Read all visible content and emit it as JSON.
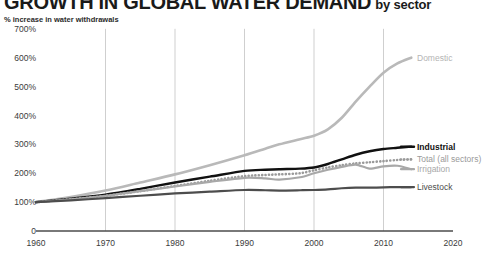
{
  "header": {
    "title": "GROWTH IN GLOBAL WATER DEMAND",
    "title_suffix": "by sector",
    "subtitle": "% increase in water withdrawals"
  },
  "chart_data": {
    "type": "line",
    "subtitle": "% increase in water withdrawals",
    "xlabel": "",
    "ylabel": "% increase in water withdrawals",
    "xlim": [
      1960,
      2020
    ],
    "ylim": [
      0,
      700
    ],
    "grid": "vertical",
    "legend_position": "right-inline-labels",
    "ytick_labels": [
      "0",
      "100%",
      "200%",
      "300%",
      "400%",
      "500%",
      "600%",
      "700%"
    ],
    "ytick_values": [
      0,
      100,
      200,
      300,
      400,
      500,
      600,
      700
    ],
    "xtick_labels": [
      "1960",
      "1970",
      "1980",
      "1990",
      "2000",
      "2010",
      "2020"
    ],
    "xtick_values": [
      1960,
      1970,
      1980,
      1990,
      2000,
      2010,
      2020
    ],
    "x": [
      1960,
      1965,
      1970,
      1975,
      1980,
      1985,
      1990,
      1993,
      1995,
      1998,
      2000,
      2002,
      2004,
      2006,
      2008,
      2010,
      2012,
      2014
    ],
    "series": [
      {
        "name": "Domestic",
        "color": "#b9b9b9",
        "width": 2.6,
        "style": "solid",
        "label_y": 600,
        "values": [
          100,
          118,
          140,
          168,
          196,
          228,
          262,
          285,
          300,
          318,
          330,
          352,
          392,
          448,
          500,
          548,
          580,
          600
        ]
      },
      {
        "name": "Industrial",
        "color": "#111111",
        "width": 2.4,
        "style": "solid",
        "label_y": 292,
        "values": [
          100,
          112,
          126,
          146,
          168,
          188,
          208,
          212,
          214,
          216,
          220,
          232,
          248,
          264,
          276,
          284,
          288,
          292
        ]
      },
      {
        "name": "Total (all sectors)",
        "color": "#9a9a9a",
        "width": 2.2,
        "style": "dotted",
        "label_y": 248,
        "values": [
          100,
          110,
          122,
          138,
          156,
          174,
          190,
          194,
          196,
          200,
          210,
          220,
          228,
          234,
          238,
          242,
          246,
          248
        ]
      },
      {
        "name": "Irrigation",
        "color": "#a8a8a8",
        "width": 2.2,
        "style": "solid",
        "label_y": 214,
        "values": [
          100,
          110,
          122,
          138,
          154,
          170,
          184,
          182,
          178,
          186,
          200,
          212,
          222,
          230,
          216,
          224,
          226,
          214
        ]
      },
      {
        "name": "Livestock",
        "color": "#4d4d4d",
        "width": 2.2,
        "style": "solid",
        "label_y": 152,
        "values": [
          100,
          106,
          114,
          122,
          130,
          136,
          142,
          141,
          140,
          141,
          142,
          144,
          148,
          150,
          150,
          151,
          152,
          152
        ]
      }
    ]
  }
}
